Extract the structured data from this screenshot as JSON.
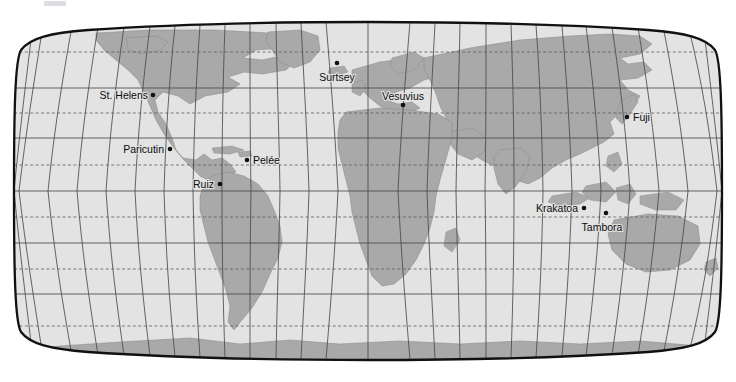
{
  "figure": {
    "kind": "world-map",
    "projection": "Robinson",
    "title": "",
    "width": 736,
    "height": 382
  },
  "colors": {
    "ocean": "#e3e3e3",
    "land": "#a9a9a9",
    "land_stroke": "#8f8f8f",
    "graticule": "#4a4a4a",
    "graticule_dashed": "#5a5a5a",
    "border": "#111111",
    "label_text": "#0d0d0d",
    "background": "#ffffff",
    "marker": "#111111"
  },
  "graticule": {
    "meridian_interval_deg": 15,
    "parallel_interval_deg": 15,
    "solid_parallels_deg": [
      60,
      30,
      0,
      -30,
      -60
    ],
    "dashed_parallels_deg": [
      75,
      45,
      15,
      -15,
      -45,
      -75
    ],
    "lon_range_deg": [
      -180,
      180
    ],
    "lat_range_deg": [
      -90,
      90
    ]
  },
  "volcanoes": [
    {
      "name": "St. Helens",
      "lon": -122.2,
      "lat": 46.2,
      "label_side": "left",
      "dot_x": 153,
      "dot_y": 95,
      "label_x": 148,
      "label_y": 95
    },
    {
      "name": "Paricutin",
      "lon": -102.3,
      "lat": 19.5,
      "label_side": "left",
      "dot_x": 170,
      "dot_y": 149,
      "label_x": 164,
      "label_y": 149
    },
    {
      "name": "Ruiz",
      "lon": -75.3,
      "lat": 4.9,
      "label_side": "left",
      "dot_x": 220,
      "dot_y": 184,
      "label_x": 214,
      "label_y": 184
    },
    {
      "name": "Pelée",
      "lon": -61.2,
      "lat": 14.8,
      "label_side": "right",
      "dot_x": 247,
      "dot_y": 160,
      "label_x": 253,
      "label_y": 160
    },
    {
      "name": "Surtsey",
      "lon": -20.3,
      "lat": 63.3,
      "label_side": "below",
      "dot_x": 337,
      "dot_y": 63,
      "label_x": 337,
      "label_y": 77
    },
    {
      "name": "Vesuvius",
      "lon": 14.4,
      "lat": 40.8,
      "label_side": "above",
      "dot_x": 403,
      "dot_y": 105,
      "label_x": 403,
      "label_y": 96
    },
    {
      "name": "Fuji",
      "lon": 138.7,
      "lat": 35.4,
      "label_side": "right",
      "dot_x": 627,
      "dot_y": 117,
      "label_x": 633,
      "label_y": 117
    },
    {
      "name": "Krakatoa",
      "lon": 105.4,
      "lat": -6.1,
      "label_side": "left",
      "dot_x": 584,
      "dot_y": 208,
      "label_x": 578,
      "label_y": 208
    },
    {
      "name": "Tambora",
      "lon": 118.0,
      "lat": -8.3,
      "label_side": "above-left",
      "dot_x": 606,
      "dot_y": 213,
      "label_x": 602,
      "label_y": 227
    }
  ]
}
